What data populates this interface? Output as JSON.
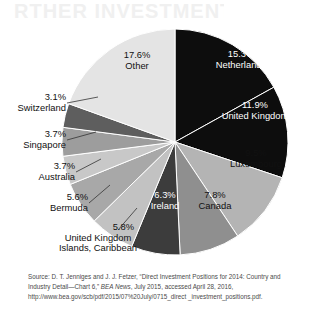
{
  "watermark": "RTHER INVESTMENTS",
  "chart_data": {
    "type": "pie",
    "title": "",
    "legend_position": "callout",
    "center": {
      "x": 175,
      "y": 142,
      "radius": 113
    },
    "start_angle_deg": 0,
    "direction": "clockwise",
    "categories": [
      "Netherlands",
      "United Kingdom",
      "Luxembourg",
      "Canada",
      "Ireland",
      "United Kingdom Islands, Caribbean",
      "Bermuda",
      "Australia",
      "Singapore",
      "Switzerland",
      "Other"
    ],
    "values": [
      15.3,
      11.9,
      9.5,
      7.8,
      6.3,
      5.8,
      5.6,
      3.7,
      3.7,
      3.1,
      17.6
    ],
    "unit": "percent",
    "slices": [
      {
        "label": "Netherlands",
        "pct": "15.3%",
        "value": 15.3,
        "color": "#0d0d0d",
        "label_placement": "inside",
        "text_color": "light"
      },
      {
        "label": "United Kingdom",
        "pct": "11.9%",
        "value": 11.9,
        "color": "#0d0d0d",
        "label_placement": "inside",
        "text_color": "light"
      },
      {
        "label": "Luxembourg",
        "pct": "9.5%",
        "value": 9.5,
        "color": "#b4b4b4",
        "label_placement": "inside",
        "text_color": "dark"
      },
      {
        "label": "Canada",
        "pct": "7.8%",
        "value": 7.8,
        "color": "#8f8f8f",
        "label_placement": "inside",
        "text_color": "dark"
      },
      {
        "label": "Ireland",
        "pct": "6.3%",
        "value": 6.3,
        "color": "#3c3c3c",
        "label_placement": "inside",
        "text_color": "light"
      },
      {
        "label": "United Kingdom Islands, Caribbean",
        "pct": "5.8%",
        "value": 5.8,
        "color": "#c2c2c2",
        "label_placement": "callout",
        "text_color": "dark"
      },
      {
        "label": "Bermuda",
        "pct": "5.6%",
        "value": 5.6,
        "color": "#a8a8a8",
        "label_placement": "callout",
        "text_color": "dark"
      },
      {
        "label": "Australia",
        "pct": "3.7%",
        "value": 3.7,
        "color": "#c8c8c8",
        "label_placement": "callout",
        "text_color": "dark"
      },
      {
        "label": "Singapore",
        "pct": "3.7%",
        "value": 3.7,
        "color": "#9d9d9d",
        "label_placement": "callout",
        "text_color": "dark"
      },
      {
        "label": "Switzerland",
        "pct": "3.1%",
        "value": 3.1,
        "color": "#5e5e5e",
        "label_placement": "callout",
        "text_color": "dark"
      },
      {
        "label": "Other",
        "pct": "17.6%",
        "value": 17.6,
        "color": "#e4e4e4",
        "label_placement": "inside",
        "text_color": "dark"
      }
    ]
  },
  "labels": {
    "netherlands_pct": "15.3%",
    "netherlands_name": "Netherlands",
    "uk_pct": "11.9%",
    "uk_name": "United Kingdom",
    "luxembourg_pct": "9.5%",
    "luxembourg_name": "Luxembourg",
    "canada_pct": "7.8%",
    "canada_name": "Canada",
    "ireland_pct": "6.3%",
    "ireland_name": "Ireland",
    "other_pct": "17.6%",
    "other_name": "Other",
    "switzerland_pct": "3.1%",
    "switzerland_name": "Switzerland",
    "singapore_pct": "3.7%",
    "singapore_name": "Singapore",
    "australia_pct": "3.7%",
    "australia_name": "Australia",
    "bermuda_pct": "5.6%",
    "bermuda_name": "Bermuda",
    "ukic_pct": "5.8%",
    "ukic_name_line1": "United Kingdom",
    "ukic_name_line2": "Islands, Caribbean"
  },
  "source": {
    "text": "Source: D. T. Jenniges and J. J. Fetzer, “Direct Investment Positions for 2014: Country and Industry Detail—Chart 6,” BEA News, July 2015, accessed April 28, 2016, http://www.bea.gov/scb/pdf/2015/07%20July/0715_direct _investment_positions.pdf.",
    "part1": "Source: D. T. Jenniges and J. J. Fetzer, “Direct Investment Positions for 2014: Country and Industry Detail—Chart 6,” ",
    "italic": "BEA News",
    "part2": ", July 2015, accessed April 28, 2016, http://www.bea.gov/scb/pdf/2015/07%20July/0715_direct _investment_positions.pdf."
  }
}
